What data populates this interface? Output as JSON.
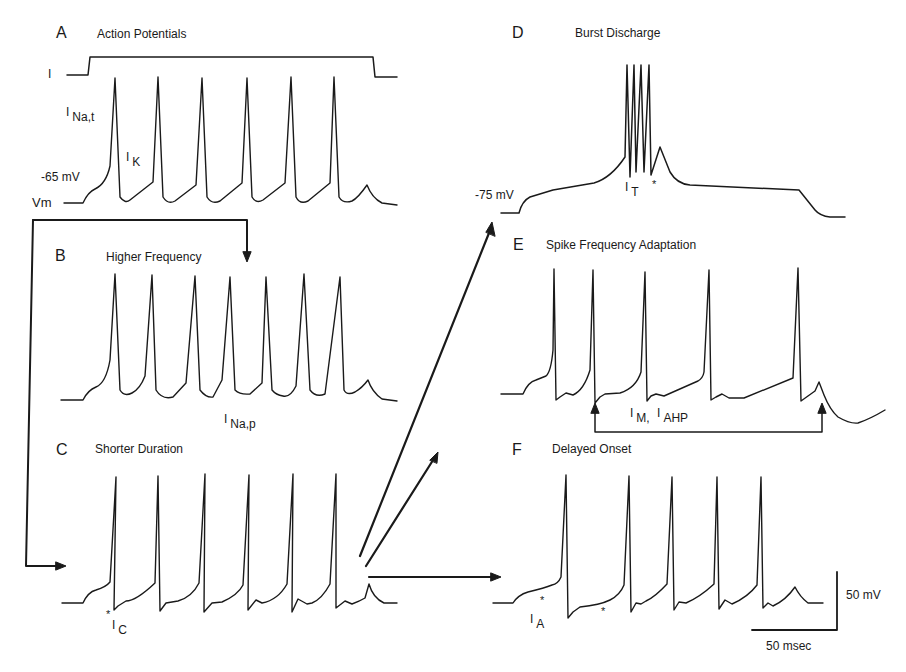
{
  "figure": {
    "panels": [
      {
        "letter": "A",
        "title": "Action Potentials"
      },
      {
        "letter": "B",
        "title": "Higher Frequency"
      },
      {
        "letter": "C",
        "title": "Shorter Duration"
      },
      {
        "letter": "D",
        "title": "Burst Discharge"
      },
      {
        "letter": "E",
        "title": "Spike Frequency Adaptation"
      },
      {
        "letter": "F",
        "title": "Delayed Onset"
      }
    ],
    "labels": {
      "current": "I",
      "vm": "Vm",
      "rest_a": "-65 mV",
      "rest_d": "-75 mV",
      "star": "*"
    },
    "currents": {
      "na_t": {
        "base": "I",
        "sub": "Na,t"
      },
      "k": {
        "base": "I",
        "sub": "K"
      },
      "na_p": {
        "base": "I",
        "sub": "Na,p"
      },
      "c": {
        "base": "I",
        "sub": "C"
      },
      "t": {
        "base": "I",
        "sub": "T"
      },
      "m": {
        "base": "I",
        "sub": "M,"
      },
      "ahp": {
        "base": "I",
        "sub": "AHP"
      },
      "a": {
        "base": "I",
        "sub": "A"
      }
    },
    "scale_bar": {
      "voltage": "50 mV",
      "time": "50 msec"
    },
    "colors": {
      "trace": "#1a1a1a",
      "background": "#ffffff"
    }
  }
}
